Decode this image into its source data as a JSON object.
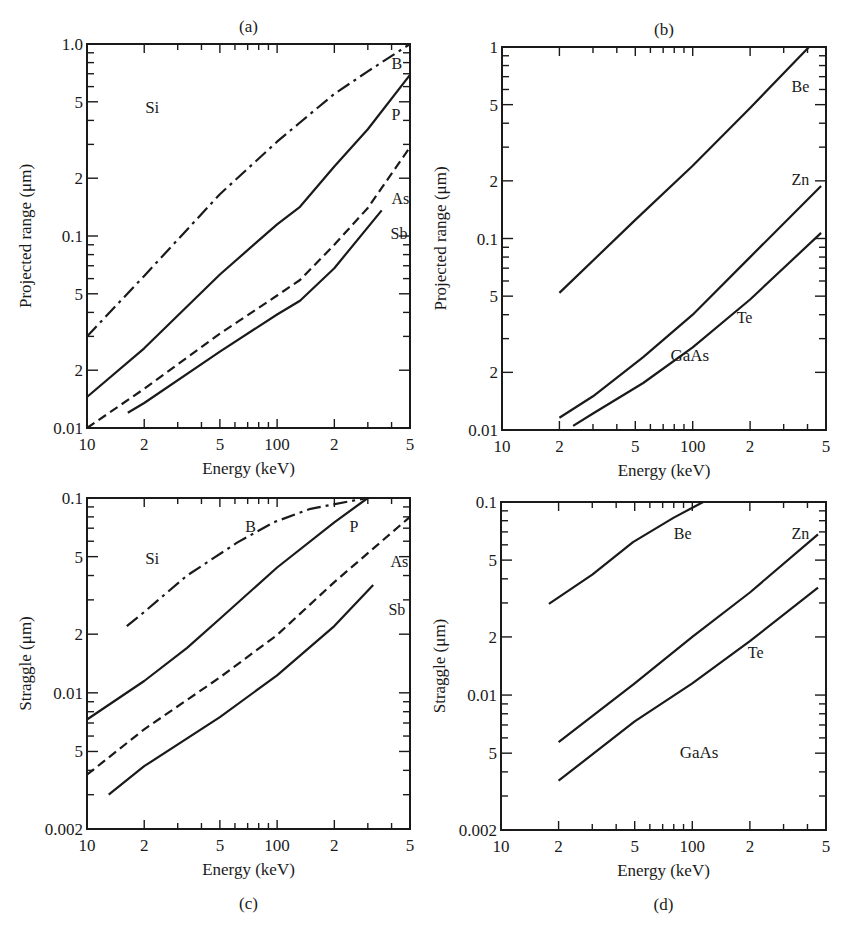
{
  "chart_data": [
    {
      "id": "a",
      "type": "line",
      "panel_label": "(a)",
      "title": "",
      "xlabel": "Energy (keV)",
      "ylabel": "Projected range (μm)",
      "xscale": "log",
      "yscale": "log",
      "xlim": [
        10,
        500
      ],
      "ylim": [
        0.01,
        1.0
      ],
      "xticks": [
        {
          "v": 10,
          "label": "10"
        },
        {
          "v": 20,
          "label": "2"
        },
        {
          "v": 50,
          "label": "5"
        },
        {
          "v": 100,
          "label": "100"
        },
        {
          "v": 200,
          "label": "2"
        },
        {
          "v": 500,
          "label": "5"
        }
      ],
      "yticks": [
        {
          "v": 0.01,
          "label": "0.01"
        },
        {
          "v": 0.02,
          "label": "2"
        },
        {
          "v": 0.05,
          "label": "5"
        },
        {
          "v": 0.1,
          "label": "0.1"
        },
        {
          "v": 0.2,
          "label": "2"
        },
        {
          "v": 0.5,
          "label": "5"
        },
        {
          "v": 1.0,
          "label": "1.0"
        }
      ],
      "substrate": "Si",
      "grid": false,
      "series": [
        {
          "name": "B",
          "style": "dashdot",
          "points": [
            [
              10,
              0.03
            ],
            [
              20,
              0.062
            ],
            [
              50,
              0.165
            ],
            [
              100,
              0.31
            ],
            [
              132,
              0.39
            ],
            [
              200,
              0.55
            ],
            [
              300,
              0.72
            ],
            [
              500,
              1.0
            ]
          ],
          "label_at": [
            400,
            0.74
          ]
        },
        {
          "name": "P",
          "style": "solid",
          "points": [
            [
              10,
              0.0145
            ],
            [
              20,
              0.026
            ],
            [
              50,
              0.063
            ],
            [
              100,
              0.115
            ],
            [
              132,
              0.142
            ],
            [
              200,
              0.23
            ],
            [
              300,
              0.36
            ],
            [
              500,
              0.69
            ]
          ],
          "label_at": [
            400,
            0.4
          ]
        },
        {
          "name": "As",
          "style": "dashed",
          "points": [
            [
              10,
              0.01
            ],
            [
              20,
              0.016
            ],
            [
              50,
              0.031
            ],
            [
              100,
              0.049
            ],
            [
              132,
              0.059
            ],
            [
              200,
              0.09
            ],
            [
              300,
              0.14
            ],
            [
              500,
              0.29
            ]
          ],
          "label_at": [
            400,
            0.147
          ]
        },
        {
          "name": "Sb",
          "style": "solid",
          "points": [
            [
              16.4,
              0.012
            ],
            [
              20,
              0.0135
            ],
            [
              50,
              0.025
            ],
            [
              100,
              0.039
            ],
            [
              132,
              0.046
            ],
            [
              200,
              0.068
            ],
            [
              355,
              0.136
            ]
          ],
          "label_at": [
            395,
            0.096
          ]
        }
      ]
    },
    {
      "id": "b",
      "type": "line",
      "panel_label": "(b)",
      "title": "",
      "xlabel": "Energy (keV)",
      "ylabel": "Projected range (μm)",
      "xscale": "log",
      "yscale": "log",
      "xlim": [
        10,
        500
      ],
      "ylim": [
        0.01,
        1
      ],
      "xticks": [
        {
          "v": 10,
          "label": "10"
        },
        {
          "v": 20,
          "label": "2"
        },
        {
          "v": 50,
          "label": "5"
        },
        {
          "v": 100,
          "label": "100"
        },
        {
          "v": 200,
          "label": "2"
        },
        {
          "v": 500,
          "label": "5"
        }
      ],
      "yticks": [
        {
          "v": 0.01,
          "label": "0.01"
        },
        {
          "v": 0.02,
          "label": "2"
        },
        {
          "v": 0.05,
          "label": "5"
        },
        {
          "v": 0.1,
          "label": "0.1"
        },
        {
          "v": 0.2,
          "label": "2"
        },
        {
          "v": 0.5,
          "label": "5"
        },
        {
          "v": 1,
          "label": "1"
        }
      ],
      "substrate": "GaAs",
      "grid": false,
      "series": [
        {
          "name": "Be",
          "style": "solid",
          "points": [
            [
              20,
              0.052
            ],
            [
              50,
              0.125
            ],
            [
              100,
              0.24
            ],
            [
              200,
              0.48
            ],
            [
              407,
              1.0
            ]
          ],
          "label_at": [
            330,
            0.58
          ]
        },
        {
          "name": "Zn",
          "style": "solid",
          "points": [
            [
              20,
              0.0116
            ],
            [
              30,
              0.015
            ],
            [
              55,
              0.024
            ],
            [
              100,
              0.04
            ],
            [
              200,
              0.08
            ],
            [
              471,
              0.188
            ]
          ],
          "label_at": [
            330,
            0.19
          ]
        },
        {
          "name": "Te",
          "style": "solid",
          "points": [
            [
              23.6,
              0.0105
            ],
            [
              30,
              0.0122
            ],
            [
              55,
              0.0176
            ],
            [
              100,
              0.027
            ],
            [
              200,
              0.048
            ],
            [
              471,
              0.107
            ]
          ],
          "label_at": [
            170,
            0.036
          ]
        }
      ]
    },
    {
      "id": "c",
      "type": "line",
      "panel_label": "(c)",
      "title": "",
      "xlabel": "Energy (keV)",
      "ylabel": "Straggle (μm)",
      "xscale": "log",
      "yscale": "log",
      "xlim": [
        10,
        500
      ],
      "ylim": [
        0.002,
        0.1
      ],
      "xticks": [
        {
          "v": 10,
          "label": "10"
        },
        {
          "v": 20,
          "label": "2"
        },
        {
          "v": 50,
          "label": "5"
        },
        {
          "v": 100,
          "label": "100"
        },
        {
          "v": 200,
          "label": "2"
        },
        {
          "v": 500,
          "label": "5"
        }
      ],
      "yticks": [
        {
          "v": 0.002,
          "label": "0.002"
        },
        {
          "v": 0.005,
          "label": "5"
        },
        {
          "v": 0.01,
          "label": "0.01"
        },
        {
          "v": 0.02,
          "label": "2"
        },
        {
          "v": 0.05,
          "label": "5"
        },
        {
          "v": 0.1,
          "label": "0.1"
        }
      ],
      "substrate": "Si",
      "grid": false,
      "series": [
        {
          "name": "B",
          "style": "dashdot",
          "points": [
            [
              16.2,
              0.022
            ],
            [
              20,
              0.026
            ],
            [
              33.6,
              0.04
            ],
            [
              61.6,
              0.059
            ],
            [
              96,
              0.075
            ],
            [
              150,
              0.088
            ],
            [
              297,
              0.1
            ]
          ],
          "label_at": [
            68,
            0.067
          ]
        },
        {
          "name": "P",
          "style": "solid",
          "points": [
            [
              10,
              0.0073
            ],
            [
              20,
              0.0115
            ],
            [
              33.6,
              0.017
            ],
            [
              50,
              0.024
            ],
            [
              100,
              0.044
            ],
            [
              200,
              0.075
            ],
            [
              300,
              0.1
            ]
          ],
          "label_at": [
            240,
            0.067
          ]
        },
        {
          "name": "As",
          "style": "dashed",
          "points": [
            [
              10,
              0.0038
            ],
            [
              20,
              0.0065
            ],
            [
              50,
              0.012
            ],
            [
              100,
              0.0198
            ],
            [
              200,
              0.037
            ],
            [
              500,
              0.08
            ]
          ],
          "label_at": [
            395,
            0.044
          ]
        },
        {
          "name": "Sb",
          "style": "solid",
          "points": [
            [
              13,
              0.003
            ],
            [
              20,
              0.0042
            ],
            [
              50,
              0.0075
            ],
            [
              100,
              0.0123
            ],
            [
              200,
              0.022
            ],
            [
              320,
              0.0358
            ]
          ],
          "label_at": [
            385,
            0.025
          ]
        }
      ]
    },
    {
      "id": "d",
      "type": "line",
      "panel_label": "(d)",
      "title": "",
      "xlabel": "Energy (keV)",
      "ylabel": "Straggle (μm)",
      "xscale": "log",
      "yscale": "log",
      "xlim": [
        10,
        500
      ],
      "ylim": [
        0.002,
        0.1
      ],
      "xticks": [
        {
          "v": 10,
          "label": "10"
        },
        {
          "v": 20,
          "label": "2"
        },
        {
          "v": 50,
          "label": "5"
        },
        {
          "v": 100,
          "label": "100"
        },
        {
          "v": 200,
          "label": "2"
        },
        {
          "v": 500,
          "label": "5"
        }
      ],
      "yticks": [
        {
          "v": 0.002,
          "label": "0.002"
        },
        {
          "v": 0.005,
          "label": "5"
        },
        {
          "v": 0.01,
          "label": "0.01"
        },
        {
          "v": 0.02,
          "label": "2"
        },
        {
          "v": 0.05,
          "label": "5"
        },
        {
          "v": 0.1,
          "label": "0.1"
        }
      ],
      "substrate": "GaAs",
      "grid": false,
      "series": [
        {
          "name": "Be",
          "style": "solid",
          "points": [
            [
              17.8,
              0.0297
            ],
            [
              30,
              0.042
            ],
            [
              49,
              0.062
            ],
            [
              80,
              0.083
            ],
            [
              114,
              0.1
            ]
          ],
          "label_at": [
            80,
            0.064
          ]
        },
        {
          "name": "Zn",
          "style": "solid",
          "points": [
            [
              20,
              0.0057
            ],
            [
              50,
              0.0115
            ],
            [
              100,
              0.02
            ],
            [
              200,
              0.034
            ],
            [
              454,
              0.068
            ]
          ],
          "label_at": [
            330,
            0.064
          ]
        },
        {
          "name": "Te",
          "style": "solid",
          "points": [
            [
              20,
              0.0036
            ],
            [
              50,
              0.0073
            ],
            [
              100,
              0.0115
            ],
            [
              200,
              0.019
            ],
            [
              454,
              0.036
            ]
          ],
          "label_at": [
            195,
            0.0155
          ]
        }
      ]
    }
  ],
  "layout": {
    "panels": {
      "a": {
        "x0": 87,
        "y0": 44,
        "x1": 410,
        "y1": 428
      },
      "b": {
        "x0": 502,
        "y0": 47,
        "x1": 826,
        "y1": 430
      },
      "c": {
        "x0": 87,
        "y0": 498,
        "x1": 410,
        "y1": 829
      },
      "d": {
        "x0": 501,
        "y0": 502,
        "x1": 826,
        "y1": 830
      }
    }
  },
  "colors": {
    "ink": "#1a1a1a",
    "background": "#ffffff"
  }
}
